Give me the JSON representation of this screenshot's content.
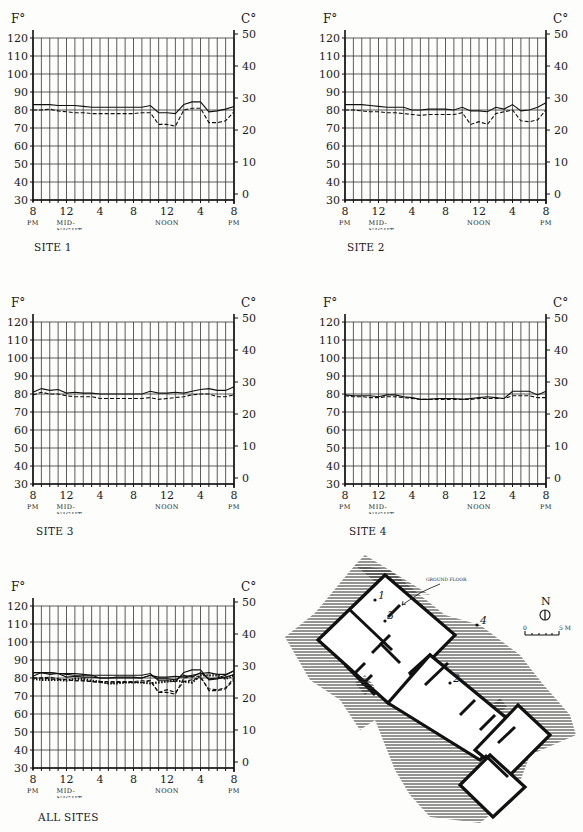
{
  "page": {
    "axis_units": {
      "left": "F°",
      "right": "C°"
    },
    "x_tick_labels": [
      {
        "hour": 0,
        "line1": "8",
        "line2": "PM",
        "line3": ""
      },
      {
        "hour": 4,
        "line1": "12",
        "line2": "MID-",
        "line3": "NIGHT"
      },
      {
        "hour": 8,
        "line1": "4",
        "line2": "",
        "line3": ""
      },
      {
        "hour": 12,
        "line1": "8",
        "line2": "",
        "line3": ""
      },
      {
        "hour": 16,
        "line1": "12",
        "line2": "NOON",
        "line3": ""
      },
      {
        "hour": 20,
        "line1": "4",
        "line2": "",
        "line3": ""
      },
      {
        "hour": 24,
        "line1": "8",
        "line2": "PM",
        "line3": ""
      }
    ],
    "f_ticks": [
      120,
      110,
      100,
      90,
      80,
      70,
      60,
      50,
      40,
      30
    ],
    "c_ticks": [
      50,
      40,
      30,
      20,
      10,
      0
    ]
  },
  "chart_data": [
    {
      "type": "line",
      "title": "SITE 1",
      "xlabel": "Time of day (8 PM to 8 PM)",
      "ylabel": "F°",
      "y2label": "C°",
      "ylim": [
        30,
        120
      ],
      "y2lim": [
        0,
        50
      ],
      "x": [
        0,
        1,
        2,
        3,
        4,
        5,
        6,
        7,
        8,
        9,
        10,
        11,
        12,
        13,
        14,
        15,
        16,
        17,
        18,
        19,
        20,
        21,
        22,
        23,
        24
      ],
      "series": [
        {
          "name": "solid",
          "style": "solid",
          "values": [
            83,
            83,
            83,
            82.5,
            82.5,
            82.5,
            82,
            81.5,
            81.5,
            81.5,
            81.5,
            81.5,
            81.5,
            81.5,
            82.5,
            78.5,
            78.5,
            78,
            83,
            84.5,
            84.5,
            79,
            79.5,
            80.5,
            82
          ]
        },
        {
          "name": "dashed",
          "style": "dashed",
          "values": [
            80,
            80,
            80.5,
            79.5,
            79,
            78.5,
            78.5,
            78,
            78,
            78,
            78,
            78,
            78,
            78.5,
            78.5,
            72,
            72,
            71,
            80,
            81,
            81,
            73,
            73,
            74,
            79
          ]
        }
      ],
      "grid": true
    },
    {
      "type": "line",
      "title": "SITE 2",
      "xlabel": "Time of day (8 PM to 8 PM)",
      "ylabel": "F°",
      "y2label": "C°",
      "ylim": [
        30,
        120
      ],
      "y2lim": [
        0,
        50
      ],
      "x": [
        0,
        1,
        2,
        3,
        4,
        5,
        6,
        7,
        8,
        9,
        10,
        11,
        12,
        13,
        14,
        15,
        16,
        17,
        18,
        19,
        20,
        21,
        22,
        23,
        24
      ],
      "series": [
        {
          "name": "solid",
          "style": "solid",
          "values": [
            83,
            83,
            83,
            82.5,
            82,
            81.5,
            81.5,
            81.5,
            80,
            80,
            80.5,
            80.5,
            80.5,
            80,
            81.5,
            79.5,
            79.5,
            79,
            81.5,
            80.5,
            83,
            79.5,
            80,
            81.5,
            84
          ]
        },
        {
          "name": "dashed",
          "style": "dashed",
          "values": [
            80,
            80,
            79.5,
            79,
            79,
            78.5,
            78.5,
            78,
            77.5,
            77,
            77.5,
            77.5,
            77.5,
            77.5,
            78.5,
            72,
            73.5,
            72,
            78,
            79,
            80,
            74,
            73.5,
            74.5,
            80
          ]
        }
      ],
      "grid": true
    },
    {
      "type": "line",
      "title": "SITE 3",
      "xlabel": "Time of day (8 PM to 8 PM)",
      "ylabel": "F°",
      "y2label": "C°",
      "ylim": [
        30,
        120
      ],
      "y2lim": [
        0,
        50
      ],
      "x": [
        0,
        1,
        2,
        3,
        4,
        5,
        6,
        7,
        8,
        9,
        10,
        11,
        12,
        13,
        14,
        15,
        16,
        17,
        18,
        19,
        20,
        21,
        22,
        23,
        24
      ],
      "series": [
        {
          "name": "solid",
          "style": "solid",
          "values": [
            81,
            83,
            82,
            82.5,
            80.5,
            81,
            80.5,
            80.5,
            80,
            80,
            80,
            80,
            80,
            80,
            81.5,
            80.5,
            80.5,
            81,
            80.5,
            81.5,
            82.5,
            83,
            82,
            82,
            84
          ]
        },
        {
          "name": "dashed",
          "style": "dashed",
          "values": [
            79.5,
            81,
            80,
            80,
            79,
            78.5,
            78.5,
            78.5,
            77.5,
            77.5,
            77.5,
            77.5,
            77.5,
            77.5,
            78,
            77,
            77.5,
            78,
            78.5,
            79.5,
            80,
            80,
            78.5,
            78.5,
            79.5
          ]
        }
      ],
      "grid": true
    },
    {
      "type": "line",
      "title": "SITE 4",
      "xlabel": "Time of day (8 PM to 8 PM)",
      "ylabel": "F°",
      "y2label": "C°",
      "ylim": [
        30,
        120
      ],
      "y2lim": [
        0,
        50
      ],
      "x": [
        0,
        1,
        2,
        3,
        4,
        5,
        6,
        7,
        8,
        9,
        10,
        11,
        12,
        13,
        14,
        15,
        16,
        17,
        18,
        19,
        20,
        21,
        22,
        23,
        24
      ],
      "series": [
        {
          "name": "solid",
          "style": "solid",
          "values": [
            79.5,
            79,
            79,
            79,
            78.5,
            79.5,
            79.5,
            78.5,
            78,
            77,
            77,
            77.5,
            77.5,
            77.5,
            77,
            77.5,
            78,
            78.5,
            78,
            77.5,
            81.5,
            81.5,
            81.5,
            79.5,
            81.5
          ]
        },
        {
          "name": "dashed",
          "style": "dashed",
          "values": [
            79,
            78.5,
            78.5,
            78,
            78,
            78.5,
            78.5,
            78,
            77.5,
            77,
            77,
            77,
            77,
            77,
            77,
            77,
            77.5,
            77.5,
            77.5,
            77.5,
            79,
            79,
            79,
            78,
            78
          ]
        }
      ],
      "grid": true
    },
    {
      "type": "line",
      "title": "ALL SITES",
      "xlabel": "Time of day (8 PM to 8 PM)",
      "ylabel": "F°",
      "y2label": "C°",
      "ylim": [
        30,
        120
      ],
      "y2lim": [
        0,
        50
      ],
      "x": [
        0,
        1,
        2,
        3,
        4,
        5,
        6,
        7,
        8,
        9,
        10,
        11,
        12,
        13,
        14,
        15,
        16,
        17,
        18,
        19,
        20,
        21,
        22,
        23,
        24
      ],
      "series": [
        {
          "name": "site-1-solid",
          "style": "solid",
          "values": [
            83,
            83,
            83,
            82.5,
            82.5,
            82.5,
            82,
            81.5,
            81.5,
            81.5,
            81.5,
            81.5,
            81.5,
            81.5,
            82.5,
            78.5,
            78.5,
            78,
            83,
            84.5,
            84.5,
            79,
            79.5,
            80.5,
            82
          ]
        },
        {
          "name": "site-1-dashed",
          "style": "dashed",
          "values": [
            80,
            80,
            80.5,
            79.5,
            79,
            78.5,
            78.5,
            78,
            78,
            78,
            78,
            78,
            78,
            78.5,
            78.5,
            72,
            72,
            71,
            80,
            81,
            81,
            73,
            73,
            74,
            79
          ]
        },
        {
          "name": "site-2-solid",
          "style": "solid",
          "values": [
            83,
            83,
            83,
            82.5,
            82,
            81.5,
            81.5,
            81.5,
            80,
            80,
            80.5,
            80.5,
            80.5,
            80,
            81.5,
            79.5,
            79.5,
            79,
            81.5,
            80.5,
            83,
            79.5,
            80,
            81.5,
            84
          ]
        },
        {
          "name": "site-2-dashed",
          "style": "dashed",
          "values": [
            80,
            80,
            79.5,
            79,
            79,
            78.5,
            78.5,
            78,
            77.5,
            77,
            77.5,
            77.5,
            77.5,
            77.5,
            78.5,
            72,
            73.5,
            72,
            78,
            79,
            80,
            74,
            73.5,
            74.5,
            80
          ]
        },
        {
          "name": "site-3-solid",
          "style": "solid",
          "values": [
            81,
            83,
            82,
            82.5,
            80.5,
            81,
            80.5,
            80.5,
            80,
            80,
            80,
            80,
            80,
            80,
            81.5,
            80.5,
            80.5,
            81,
            80.5,
            81.5,
            82.5,
            83,
            82,
            82,
            84
          ]
        },
        {
          "name": "site-4-dotted",
          "style": "dotted",
          "values": [
            79.5,
            79,
            79,
            79,
            78.5,
            79.5,
            79.5,
            78.5,
            78,
            77,
            77,
            77.5,
            77.5,
            77.5,
            77,
            77.5,
            78,
            78.5,
            78,
            77.5,
            81.5,
            81.5,
            81.5,
            79.5,
            81.5
          ]
        }
      ],
      "grid": true
    }
  ],
  "site_labels": [
    "SITE 1",
    "SITE 2",
    "SITE 3",
    "SITE 4",
    "ALL SITES"
  ],
  "plan": {
    "floor_label": "GROUND FLOOR",
    "point_labels": [
      "1",
      "2",
      "3",
      "4"
    ],
    "north_label": "N",
    "scale_start": "0",
    "scale_end": "5 M"
  }
}
